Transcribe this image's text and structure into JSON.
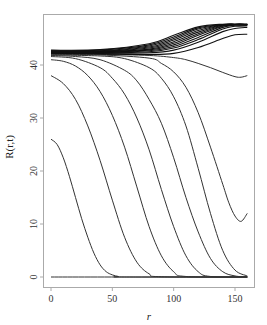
{
  "chart_data": {
    "type": "line",
    "title": "",
    "xlabel": "r",
    "ylabel": "R(r,t)",
    "xlim": [
      -4,
      165
    ],
    "ylim": [
      -2,
      49
    ],
    "grid": false,
    "legend": null,
    "x_ticks": [
      0,
      50,
      100,
      150
    ],
    "y_ticks": [
      0,
      10,
      20,
      30,
      40
    ],
    "line_color": "#333333",
    "series": [
      {
        "name": "t0",
        "x": [
          0,
          160
        ],
        "y": [
          0,
          0
        ]
      },
      {
        "name": "t1",
        "x": [
          0,
          5,
          10,
          15,
          20,
          25,
          30,
          35,
          40,
          45,
          50,
          55,
          60,
          160
        ],
        "y": [
          26,
          25,
          22.5,
          19,
          15,
          11,
          7.5,
          4.5,
          2.3,
          1,
          0.4,
          0.1,
          0,
          0
        ]
      },
      {
        "name": "t2",
        "x": [
          0,
          10,
          20,
          30,
          40,
          50,
          60,
          70,
          80,
          90,
          160
        ],
        "y": [
          38,
          36.5,
          33.5,
          28.5,
          22,
          14.5,
          7.5,
          2.8,
          0.6,
          0.05,
          0
        ]
      },
      {
        "name": "t3",
        "x": [
          0,
          10,
          20,
          30,
          40,
          50,
          60,
          70,
          80,
          90,
          100,
          110,
          160
        ],
        "y": [
          41,
          40.7,
          39.8,
          38,
          35,
          30.5,
          24.5,
          17,
          9.5,
          4,
          1,
          0.1,
          0
        ]
      },
      {
        "name": "t4",
        "x": [
          0,
          20,
          40,
          50,
          60,
          70,
          80,
          90,
          100,
          110,
          120,
          130,
          160
        ],
        "y": [
          41.6,
          41.2,
          39.5,
          37.5,
          34.5,
          30,
          24,
          16.5,
          9.5,
          4,
          1,
          0.1,
          0
        ]
      },
      {
        "name": "t5",
        "x": [
          0,
          20,
          40,
          60,
          70,
          80,
          90,
          100,
          110,
          120,
          130,
          140,
          150,
          160
        ],
        "y": [
          41.8,
          41.6,
          41,
          39,
          37,
          33.5,
          29,
          22.5,
          15,
          8.5,
          3.5,
          1,
          0.2,
          0
        ]
      },
      {
        "name": "t6",
        "x": [
          0,
          40,
          60,
          80,
          90,
          100,
          110,
          120,
          130,
          140,
          150,
          160
        ],
        "y": [
          41.9,
          41.7,
          41.2,
          39.5,
          37.5,
          34,
          28.5,
          20.5,
          12,
          5,
          1.3,
          0.2
        ]
      },
      {
        "name": "t7",
        "x": [
          0,
          40,
          80,
          90,
          100,
          110,
          120,
          130,
          140,
          145,
          150,
          155,
          160
        ],
        "y": [
          42,
          41.9,
          41.3,
          40.3,
          38.7,
          35.8,
          31,
          24.5,
          17.5,
          14,
          11.5,
          10.5,
          12
        ]
      },
      {
        "name": "t8",
        "x": [
          0,
          40,
          80,
          100,
          110,
          120,
          130,
          140,
          150,
          155,
          160
        ],
        "y": [
          42.1,
          42,
          41.8,
          41.4,
          41,
          40.3,
          39.5,
          38.6,
          37.8,
          37.7,
          38
        ]
      },
      {
        "name": "t9",
        "x": [
          0,
          40,
          80,
          100,
          120,
          140,
          150,
          160
        ],
        "y": [
          42.2,
          42.1,
          42,
          42.2,
          43.3,
          45,
          45.7,
          45.8
        ]
      },
      {
        "name": "t10",
        "x": [
          0,
          40,
          80,
          100,
          120,
          140,
          150,
          160
        ],
        "y": [
          42.3,
          42.2,
          42.3,
          42.8,
          44.3,
          46.3,
          46.9,
          47.1
        ]
      },
      {
        "name": "t11",
        "x": [
          0,
          40,
          80,
          100,
          120,
          140,
          150,
          160
        ],
        "y": [
          42.35,
          42.3,
          42.5,
          43.2,
          44.8,
          46.8,
          47.3,
          47.4
        ]
      },
      {
        "name": "t12",
        "x": [
          0,
          40,
          80,
          100,
          120,
          140,
          150,
          160
        ],
        "y": [
          42.4,
          42.35,
          42.7,
          43.5,
          45.2,
          47.1,
          47.5,
          47.5
        ]
      },
      {
        "name": "t13",
        "x": [
          0,
          40,
          80,
          100,
          120,
          140,
          150,
          160
        ],
        "y": [
          42.45,
          42.4,
          42.85,
          43.8,
          45.6,
          47.3,
          47.6,
          47.6
        ]
      },
      {
        "name": "t14",
        "x": [
          0,
          40,
          80,
          100,
          120,
          140,
          150,
          160
        ],
        "y": [
          42.5,
          42.5,
          43,
          44.1,
          45.9,
          47.4,
          47.6,
          47.6
        ]
      },
      {
        "name": "t15",
        "x": [
          0,
          40,
          80,
          100,
          120,
          140,
          150,
          160
        ],
        "y": [
          42.55,
          42.55,
          43.2,
          44.4,
          46.2,
          47.5,
          47.65,
          47.65
        ]
      },
      {
        "name": "t16",
        "x": [
          0,
          40,
          80,
          100,
          120,
          140,
          150,
          160
        ],
        "y": [
          42.6,
          42.6,
          43.4,
          44.7,
          46.5,
          47.55,
          47.65,
          47.65
        ]
      },
      {
        "name": "t17",
        "x": [
          0,
          40,
          80,
          100,
          120,
          140,
          150,
          160
        ],
        "y": [
          42.65,
          42.7,
          43.6,
          45,
          46.8,
          47.6,
          47.7,
          47.7
        ]
      },
      {
        "name": "t18",
        "x": [
          0,
          40,
          80,
          100,
          120,
          140,
          150,
          160
        ],
        "y": [
          42.7,
          42.8,
          43.8,
          45.3,
          47,
          47.65,
          47.7,
          47.7
        ]
      },
      {
        "name": "t19",
        "x": [
          0,
          40,
          80,
          100,
          120,
          140,
          150,
          160
        ],
        "y": [
          42.8,
          42.9,
          44,
          45.6,
          47.2,
          47.7,
          47.7,
          47.7
        ]
      }
    ]
  },
  "axes": {
    "x_title": "r",
    "y_title": "R(r,t)",
    "x_tick_labels": [
      "0",
      "50",
      "100",
      "150"
    ],
    "y_tick_labels": [
      "0",
      "10",
      "20",
      "30",
      "40"
    ]
  }
}
